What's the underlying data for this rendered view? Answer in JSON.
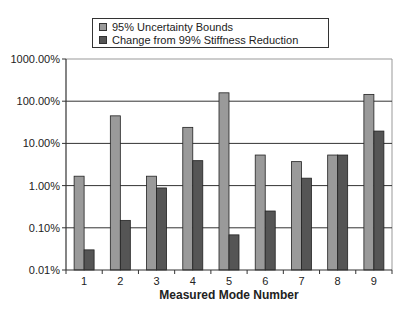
{
  "chart_data": {
    "type": "bar",
    "title": "",
    "xlabel": "Measured Mode Number",
    "ylabel": "",
    "yscale": "log",
    "ylim": [
      0.01,
      1000
    ],
    "yticks": [
      "1000.00%",
      "100.00%",
      "10.00%",
      "1.00%",
      "0.10%",
      "0.01%"
    ],
    "categories": [
      "1",
      "2",
      "3",
      "4",
      "5",
      "6",
      "7",
      "8",
      "9"
    ],
    "series": [
      {
        "name": "95% Uncertainty Bounds",
        "color": "#9a9a9a",
        "values": [
          1.67,
          45,
          1.67,
          24,
          158,
          5.3,
          3.7,
          5.3,
          145
        ]
      },
      {
        "name": "Change from 99% Stiffness Reduction",
        "color": "#555555",
        "values": [
          0.03,
          0.15,
          0.88,
          3.9,
          0.068,
          0.25,
          1.5,
          5.3,
          19.6
        ]
      }
    ],
    "units": "%",
    "grid": true,
    "legend_position": "top"
  },
  "legend": {
    "items": [
      {
        "label": "95% Uncertainty Bounds",
        "color": "#9a9a9a"
      },
      {
        "label": "Change from 99% Stiffness Reduction",
        "color": "#555555"
      }
    ]
  }
}
